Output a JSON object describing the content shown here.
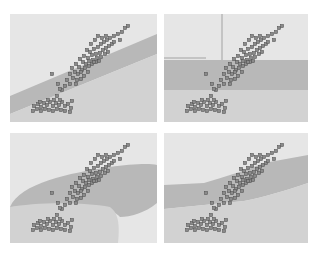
{
  "figure": {
    "colors": {
      "background_light": "#e6e6e6",
      "region_dark": "#b4b4b4",
      "region_mid": "#cfcfcf",
      "point_fill": "#8a8a8a",
      "point_stroke": "#555555"
    }
  },
  "chart_data": [
    {
      "type": "scatter",
      "panel": "top-left",
      "title": "",
      "xlabel": "",
      "ylabel": "",
      "boundary": "linear diagonal band",
      "regions": [
        {
          "shape": "polygon",
          "fill": "#b8b8b8",
          "points": [
            [
              0,
              82
            ],
            [
              147,
              20
            ],
            [
              147,
              40
            ],
            [
              0,
              100
            ]
          ]
        },
        {
          "shape": "polygon",
          "fill": "#d2d2d2",
          "points": [
            [
              0,
              100
            ],
            [
              147,
              40
            ],
            [
              147,
              108
            ],
            [
              0,
              108
            ]
          ]
        }
      ]
    },
    {
      "type": "scatter",
      "panel": "top-right",
      "title": "",
      "xlabel": "",
      "ylabel": "",
      "boundary": "axis-aligned (tree) splits",
      "regions": [
        {
          "shape": "polygon",
          "fill": "#b8b8b8",
          "points": [
            [
              0,
              46
            ],
            [
              144,
              46
            ],
            [
              144,
              76
            ],
            [
              0,
              76
            ]
          ]
        },
        {
          "shape": "polygon",
          "fill": "#d2d2d2",
          "points": [
            [
              0,
              76
            ],
            [
              144,
              76
            ],
            [
              144,
              108
            ],
            [
              0,
              108
            ]
          ]
        },
        {
          "shape": "line",
          "stroke": "#c4c4c4",
          "points": [
            [
              58,
              0
            ],
            [
              58,
              46
            ]
          ]
        },
        {
          "shape": "line",
          "stroke": "#c4c4c4",
          "points": [
            [
              0,
              44
            ],
            [
              42,
              44
            ]
          ]
        }
      ]
    },
    {
      "type": "scatter",
      "panel": "bottom-left",
      "title": "",
      "xlabel": "",
      "ylabel": "",
      "boundary": "smooth curved regions (e.g. kernel/quadratic)",
      "regions": [
        {
          "shape": "path",
          "fill": "#b8b8b8",
          "d": "M0,74 C10,50 60,40 100,34 C120,31 140,30 147,32 L147,70 C135,80 120,84 110,84 C100,72 60,70 30,72 C15,73 5,74 0,74 Z"
        },
        {
          "shape": "path",
          "fill": "#d2d2d2",
          "d": "M0,74 C20,70 70,68 100,74 C108,80 110,90 108,110 L0,110 Z"
        }
      ]
    },
    {
      "type": "scatter",
      "panel": "bottom-right",
      "title": "",
      "xlabel": "",
      "ylabel": "",
      "boundary": "piecewise / wavy band",
      "regions": [
        {
          "shape": "path",
          "fill": "#b8b8b8",
          "d": "M0,52 L40,50 C60,44 80,38 100,30 L144,22 L144,50 C120,58 100,64 80,68 L40,72 L0,76 Z"
        },
        {
          "shape": "path",
          "fill": "#d2d2d2",
          "d": "M0,76 L40,72 L80,68 C100,64 120,58 144,50 L144,110 L0,110 Z"
        }
      ]
    }
  ],
  "points": {
    "cluster_upper_right": [
      [
        77,
        36
      ],
      [
        80,
        38
      ],
      [
        84,
        35
      ],
      [
        88,
        33
      ],
      [
        91,
        30
      ],
      [
        94,
        28
      ],
      [
        97,
        26
      ],
      [
        100,
        24
      ],
      [
        104,
        22
      ],
      [
        108,
        20
      ],
      [
        112,
        18
      ],
      [
        115,
        14
      ],
      [
        118,
        12
      ],
      [
        74,
        42
      ],
      [
        78,
        44
      ],
      [
        82,
        41
      ],
      [
        86,
        40
      ],
      [
        90,
        39
      ],
      [
        93,
        36
      ],
      [
        96,
        34
      ],
      [
        99,
        32
      ],
      [
        102,
        30
      ],
      [
        70,
        45
      ],
      [
        73,
        48
      ],
      [
        76,
        50
      ],
      [
        79,
        47
      ],
      [
        83,
        46
      ],
      [
        87,
        44
      ],
      [
        91,
        43
      ],
      [
        95,
        40
      ],
      [
        98,
        38
      ],
      [
        66,
        50
      ],
      [
        69,
        53
      ],
      [
        72,
        56
      ],
      [
        75,
        54
      ],
      [
        79,
        52
      ],
      [
        82,
        50
      ],
      [
        86,
        48
      ],
      [
        89,
        47
      ],
      [
        62,
        54
      ],
      [
        65,
        58
      ],
      [
        68,
        60
      ],
      [
        71,
        58
      ],
      [
        74,
        62
      ],
      [
        60,
        60
      ],
      [
        63,
        64
      ],
      [
        67,
        66
      ],
      [
        57,
        66
      ],
      [
        60,
        70
      ],
      [
        55,
        72
      ],
      [
        52,
        76
      ],
      [
        47,
        82
      ],
      [
        88,
        22
      ],
      [
        92,
        24
      ],
      [
        85,
        26
      ],
      [
        81,
        30
      ],
      [
        110,
        26
      ],
      [
        104,
        28
      ],
      [
        96,
        22
      ],
      [
        84,
        48
      ],
      [
        78,
        58
      ],
      [
        71,
        65
      ],
      [
        66,
        70
      ]
    ],
    "cluster_lower_left": [
      [
        24,
        92
      ],
      [
        28,
        90
      ],
      [
        31,
        93
      ],
      [
        34,
        89
      ],
      [
        37,
        91
      ],
      [
        40,
        88
      ],
      [
        43,
        92
      ],
      [
        46,
        89
      ],
      [
        49,
        91
      ],
      [
        52,
        88
      ],
      [
        55,
        92
      ],
      [
        58,
        90
      ],
      [
        61,
        94
      ],
      [
        27,
        95
      ],
      [
        31,
        97
      ],
      [
        35,
        95
      ],
      [
        39,
        96
      ],
      [
        43,
        97
      ],
      [
        47,
        95
      ],
      [
        51,
        96
      ],
      [
        55,
        97
      ],
      [
        30,
        88
      ],
      [
        38,
        86
      ],
      [
        44,
        86
      ],
      [
        50,
        86
      ],
      [
        62,
        87
      ],
      [
        23,
        97
      ],
      [
        60,
        98
      ]
    ],
    "outliers": [
      [
        42,
        60
      ],
      [
        48,
        70
      ],
      [
        50,
        75
      ]
    ]
  }
}
